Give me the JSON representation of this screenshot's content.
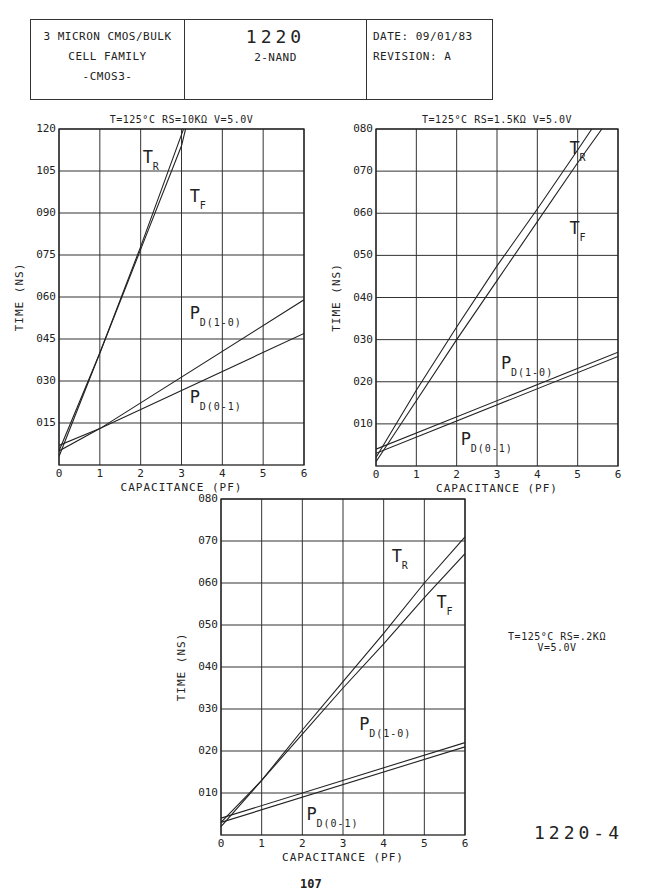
{
  "title_block": {
    "left_lines": [
      "3 MICRON CMOS/BULK",
      "CELL FAMILY",
      "-CMOS3-"
    ],
    "cell_number": "1220",
    "cell_name": "2-NAND",
    "date_label": "DATE: 09/01/83",
    "revision_label": "REVISION: A"
  },
  "footer": {
    "figure_id": "1220-4",
    "page_number": "107"
  },
  "chart_data": [
    {
      "type": "line",
      "title": "T=125°C RS=10KΩ V=5.0V",
      "xlabel": "CAPACITANCE (PF)",
      "ylabel": "TIME (NS)",
      "xlim": [
        0,
        6
      ],
      "ylim": [
        0,
        120
      ],
      "x_ticks": [
        "0",
        "1",
        "2",
        "3",
        "4",
        "5",
        "6"
      ],
      "y_ticks": [
        "120",
        "105",
        "090",
        "075",
        "060",
        "045",
        "030",
        "015"
      ],
      "y_tick_values": [
        120,
        105,
        90,
        75,
        60,
        45,
        30,
        15
      ],
      "grid": true,
      "series": [
        {
          "name": "T_R",
          "label_main": "T",
          "label_sub": "R",
          "x": [
            0,
            1,
            2,
            3,
            3.05
          ],
          "y": [
            3,
            40,
            78,
            118,
            120
          ],
          "label_pos": [
            2.05,
            108
          ]
        },
        {
          "name": "T_F",
          "label_main": "T",
          "label_sub": "F",
          "x": [
            0,
            1,
            2,
            3,
            3.1
          ],
          "y": [
            5,
            40,
            77,
            114,
            120
          ],
          "label_pos": [
            3.2,
            94
          ]
        },
        {
          "name": "P_D(1-0)",
          "label_main": "P",
          "label_sub": "D(1-0)",
          "x": [
            0,
            1,
            6
          ],
          "y": [
            5,
            13,
            59
          ],
          "label_pos": [
            3.2,
            52
          ]
        },
        {
          "name": "P_D(0-1)",
          "label_main": "P",
          "label_sub": "D(0-1)",
          "x": [
            0,
            1,
            6
          ],
          "y": [
            7,
            13,
            47
          ],
          "label_pos": [
            3.2,
            22
          ]
        }
      ]
    },
    {
      "type": "line",
      "title": "T=125°C RS=1.5KΩ V=5.0V",
      "xlabel": "CAPACITANCE (PF)",
      "ylabel": "TIME (NS)",
      "xlim": [
        0,
        6
      ],
      "ylim": [
        0,
        80
      ],
      "x_ticks": [
        "0",
        "1",
        "2",
        "3",
        "4",
        "5",
        "6"
      ],
      "y_ticks": [
        "080",
        "070",
        "060",
        "050",
        "040",
        "030",
        "020",
        "010"
      ],
      "y_tick_values": [
        80,
        70,
        60,
        50,
        40,
        30,
        20,
        10
      ],
      "grid": true,
      "series": [
        {
          "name": "T_R",
          "label_main": "T",
          "label_sub": "R",
          "x": [
            0,
            1,
            2,
            3,
            4,
            5,
            5.35
          ],
          "y": [
            2,
            18,
            33,
            47.5,
            61,
            75,
            80
          ],
          "label_pos": [
            4.8,
            74
          ]
        },
        {
          "name": "T_F",
          "label_main": "T",
          "label_sub": "F",
          "x": [
            0,
            1,
            2,
            3,
            4,
            5,
            5.6
          ],
          "y": [
            1,
            15.5,
            30,
            44,
            58,
            72,
            80
          ],
          "label_pos": [
            4.8,
            55
          ]
        },
        {
          "name": "P_D(1-0)",
          "label_main": "P",
          "label_sub": "D(1-0)",
          "x": [
            0,
            6
          ],
          "y": [
            4,
            27
          ],
          "label_pos": [
            3.1,
            23
          ]
        },
        {
          "name": "P_D(0-1)",
          "label_main": "P",
          "label_sub": "D(0-1)",
          "x": [
            0,
            6
          ],
          "y": [
            3,
            26
          ],
          "label_pos": [
            2.1,
            5
          ]
        }
      ]
    },
    {
      "type": "line",
      "title": "T=125°C RS=.2KΩ V=5.0V",
      "xlabel": "CAPACITANCE (PF)",
      "ylabel": "TIME (NS)",
      "xlim": [
        0,
        6
      ],
      "ylim": [
        0,
        80
      ],
      "x_ticks": [
        "0",
        "1",
        "2",
        "3",
        "4",
        "5",
        "6"
      ],
      "y_ticks": [
        "080",
        "070",
        "060",
        "050",
        "040",
        "030",
        "020",
        "010"
      ],
      "y_tick_values": [
        80,
        70,
        60,
        50,
        40,
        30,
        20,
        10
      ],
      "grid": true,
      "series": [
        {
          "name": "T_R",
          "label_main": "T",
          "label_sub": "R",
          "x": [
            0,
            1,
            2,
            3,
            4,
            5,
            6
          ],
          "y": [
            2,
            13,
            25,
            36.5,
            48,
            60,
            71
          ],
          "label_pos": [
            4.2,
            65
          ]
        },
        {
          "name": "T_F",
          "label_main": "T",
          "label_sub": "F",
          "x": [
            0,
            1,
            2,
            3,
            4,
            5,
            6
          ],
          "y": [
            3,
            13,
            24,
            35,
            45.5,
            56.5,
            67
          ],
          "label_pos": [
            5.3,
            54
          ]
        },
        {
          "name": "P_D(1-0)",
          "label_main": "P",
          "label_sub": "D(1-0)",
          "x": [
            0,
            6
          ],
          "y": [
            4,
            22
          ],
          "label_pos": [
            3.4,
            25
          ]
        },
        {
          "name": "P_D(0-1)",
          "label_main": "P",
          "label_sub": "D(0-1)",
          "x": [
            0,
            6
          ],
          "y": [
            3,
            21
          ],
          "label_pos": [
            2.1,
            3.5
          ]
        }
      ]
    }
  ],
  "conditions_side": {
    "line1": "T=125°C RS=.2KΩ",
    "line2": "V=5.0V"
  },
  "layout": {
    "charts": [
      {
        "left": 59,
        "top": 129,
        "width": 245,
        "height": 336,
        "title_x": 183,
        "title_y": 124,
        "side_title": false
      },
      {
        "left": 376,
        "top": 129,
        "width": 242,
        "height": 337,
        "title_x": 497,
        "title_y": 124,
        "side_title": false
      },
      {
        "left": 221,
        "top": 499,
        "width": 244,
        "height": 336,
        "title_x": 0,
        "title_y": 0,
        "side_title": true
      }
    ],
    "line_color": "#222222",
    "grid_color": "#333333"
  }
}
